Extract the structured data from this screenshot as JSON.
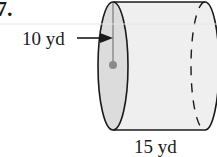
{
  "problem_number": "7.",
  "figure": {
    "shape": "cylinder",
    "orientation": "horizontal",
    "radius_label": "10 yd",
    "height_label": "15 yd",
    "colors": {
      "face_fill": "#dcdcdc",
      "body_fill": "#efefef",
      "outline": "#1a1a1a",
      "center_dot": "#8a8a8a"
    }
  }
}
